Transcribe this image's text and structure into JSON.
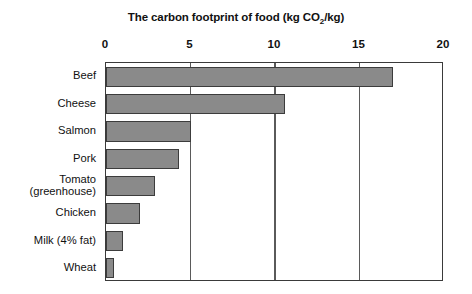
{
  "chart_data": {
    "type": "bar",
    "orientation": "horizontal",
    "title": "The carbon footprint of food (kg CO2/kg)",
    "title_parts": {
      "before": "The carbon footprint of food (kg CO",
      "subscript": "2",
      "after": "/kg)"
    },
    "xlabel": "",
    "ylabel": "",
    "xlim": [
      0,
      20
    ],
    "xticks": [
      0,
      5,
      10,
      15,
      20
    ],
    "xtick_labels": [
      "0",
      "5",
      "10",
      "15",
      "20"
    ],
    "grid": true,
    "grid_axis": "x",
    "legend": false,
    "categories": [
      "Beef",
      "Cheese",
      "Salmon",
      "Pork",
      "Tomato\n(greenhouse)",
      "Chicken",
      "Milk (4% fat)",
      "Wheat"
    ],
    "values": [
      17.0,
      10.6,
      5.0,
      4.3,
      2.9,
      2.0,
      1.0,
      0.45
    ],
    "series": [
      {
        "name": "Carbon footprint",
        "values": [
          17.0,
          10.6,
          5.0,
          4.3,
          2.9,
          2.0,
          1.0,
          0.45
        ]
      }
    ],
    "units": "kg CO2/kg",
    "colors": {
      "bar_fill": "#8a8a8a",
      "bar_border": "#3c3c3c",
      "axis": "#3a3a3a",
      "gridline": "#5a5a5a",
      "text": "#111111",
      "background": "#ffffff"
    }
  }
}
